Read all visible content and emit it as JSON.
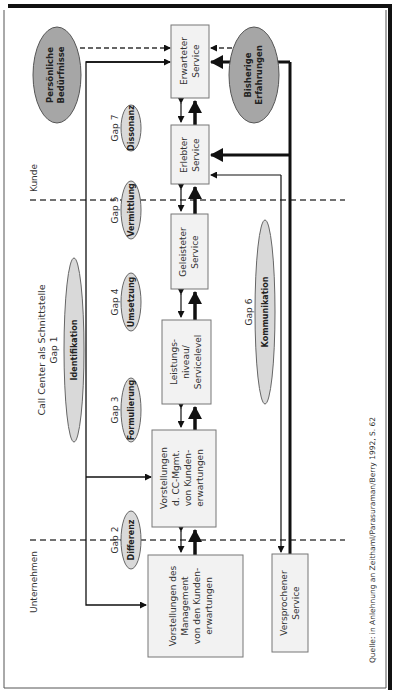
{
  "diagram": {
    "orientation": "rotated-90-ccw",
    "zones": {
      "kunde": "Kunde",
      "schnittstelle": "Call Center als Schnittstelle",
      "unternehmen": "Unternehmen"
    },
    "boxes": {
      "erwartet": [
        "Erwarteter",
        "Service"
      ],
      "erlebt": [
        "Erlebter",
        "Service"
      ],
      "geleistet": [
        "Geleisteter",
        "Service"
      ],
      "leistung": [
        "Leistungs-",
        "niveau/",
        "Servicelevel"
      ],
      "cc_mgmt": [
        "Vorstellungen",
        "d. CC-Mgmt.",
        "von Kunden-",
        "erwartungen"
      ],
      "management": [
        "Vorstellungen des",
        "Management",
        "von den Kunden-",
        "erwartungen"
      ],
      "versprochen": [
        "Versprochener",
        "Service"
      ]
    },
    "influences": {
      "persoenlich": [
        "Persönliche",
        "Bedürfnisse"
      ],
      "bisherig": [
        "Bisherige",
        "Erfahrungen"
      ]
    },
    "gaps": [
      {
        "id": "gap1",
        "label": "Gap 1",
        "name": "Identifikation"
      },
      {
        "id": "gap2",
        "label": "Gap 2",
        "name": "Differenz"
      },
      {
        "id": "gap3",
        "label": "Gap 3",
        "name": "Formulierung"
      },
      {
        "id": "gap4",
        "label": "Gap 4",
        "name": "Umsetzung"
      },
      {
        "id": "gap5",
        "label": "Gap 5",
        "name": "Vermittlung"
      },
      {
        "id": "gap6",
        "label": "Gap 6",
        "name": "Kommunikation"
      },
      {
        "id": "gap7",
        "label": "Gap 7",
        "name": "Dissonanz"
      }
    ],
    "source": "Quelle: in Anlehnung an Zeithaml/Parasuraman/Berry 1992, S. 62",
    "colors": {
      "box_fill": "#f2f2f2",
      "box_stroke": "#777777",
      "ellipse_light": "#d9d9d9",
      "ellipse_dark": "#a6a6a6",
      "line": "#111111"
    }
  }
}
